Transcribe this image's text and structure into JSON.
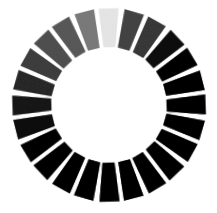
{
  "figure": {
    "background_color": "#ffffff",
    "center_color": "#ffffff"
  },
  "chart_data": {
    "type": "pie",
    "xlabel": "",
    "ylabel": "",
    "layout": {
      "center_x": 109,
      "center_y": 105,
      "inner_radius": 58,
      "outer_radius": 97,
      "patch_count": 24,
      "angular_step_deg": 15,
      "gap_deg": 3.1,
      "start_angle_deg": -90,
      "grid": false,
      "legend": false
    },
    "categories": [
      "P01",
      "P02",
      "P03",
      "P04",
      "P05",
      "P06",
      "P07",
      "P08",
      "P09",
      "P10",
      "P11",
      "P12",
      "P13",
      "P14",
      "P15",
      "P16",
      "P17",
      "P18",
      "P19",
      "P20",
      "P21",
      "P22",
      "P23",
      "P24"
    ],
    "values": [
      242,
      131,
      120,
      58,
      38,
      22,
      12,
      8,
      6,
      6,
      7,
      9,
      12,
      17,
      22,
      30,
      42,
      62,
      82,
      103,
      126,
      142,
      150,
      176
    ],
    "colors": [
      "#f2f2f2",
      "#838383",
      "#787878",
      "#3a3a3a",
      "#262626",
      "#161616",
      "#0c0c0c",
      "#080808",
      "#060606",
      "#060606",
      "#070707",
      "#090909",
      "#0c0c0c",
      "#111111",
      "#161616",
      "#1e1e1e",
      "#2a2a2a",
      "#3e3e3e",
      "#525252",
      "#676767",
      "#7e7e7e",
      "#8e8e8e",
      "#969696",
      "#b0b0b0"
    ],
    "rotations_deg": [
      -1.4,
      1.1,
      -0.7,
      1.6,
      -1.2,
      0.8,
      -1.7,
      1.3,
      -0.9,
      1.5,
      -1.1,
      0.6,
      -1.6,
      1.2,
      -0.8,
      1.7,
      -1.3,
      0.9,
      -1.5,
      1.1,
      -0.6,
      1.4,
      -1.2,
      0.7
    ],
    "series": [
      {
        "name": "patch luminance (0-255)",
        "values": [
          242,
          131,
          120,
          58,
          38,
          22,
          12,
          8,
          6,
          6,
          7,
          9,
          12,
          17,
          22,
          30,
          42,
          62,
          82,
          103,
          126,
          142,
          150,
          176
        ]
      }
    ],
    "annotations": []
  }
}
